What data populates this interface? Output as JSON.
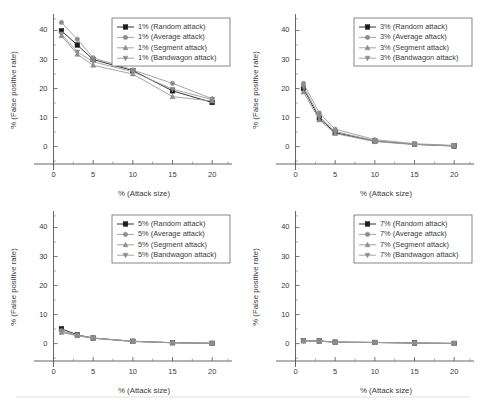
{
  "figure": {
    "background_color": "#ffffff",
    "panel_count": 4,
    "layout": "2x2 grid of line charts"
  },
  "axis": {
    "xlabel": "% (Attack size)",
    "ylabel": "% (False positive rate)",
    "xticks": [
      0,
      5,
      10,
      15,
      20
    ],
    "yticks": [
      0,
      10,
      20,
      30,
      40
    ],
    "xlim": [
      -1.2,
      22.5
    ],
    "ylim": [
      -6,
      45
    ],
    "grid": false
  },
  "series_styles": [
    {
      "key": "random",
      "marker": "filled-square",
      "color": "#1b1b1b",
      "line_color": "#1b1b1b"
    },
    {
      "key": "average",
      "marker": "filled-circle",
      "color": "#8c8c8c",
      "line_color": "#9a9a9a"
    },
    {
      "key": "segment",
      "marker": "up-triangle",
      "color": "#8c8c8c",
      "line_color": "#9a9a9a"
    },
    {
      "key": "bandwagon",
      "marker": "down-triangle",
      "color": "#8c8c8c",
      "line_color": "#9a9a9a"
    }
  ],
  "chart_data": [
    {
      "id": "panel-1pct",
      "type": "line",
      "title": "",
      "xlabel": "% (Attack size)",
      "ylabel": "% (False positive rate)",
      "x": [
        1,
        3,
        5,
        10,
        15,
        20
      ],
      "xlim": [
        -1.2,
        22.5
      ],
      "ylim": [
        -6,
        45
      ],
      "xticks": [
        0,
        5,
        10,
        15,
        20
      ],
      "yticks": [
        0,
        10,
        20,
        30,
        40
      ],
      "grid": false,
      "legend_position": "top-right",
      "series": [
        {
          "name": "1% (Random attack)",
          "key": "random",
          "values": [
            39.9,
            35.0,
            30.0,
            26.2,
            19.2,
            15.2
          ]
        },
        {
          "name": "1% (Average attack)",
          "key": "average",
          "values": [
            42.8,
            37.0,
            30.6,
            26.4,
            21.8,
            16.5
          ]
        },
        {
          "name": "1% (Segment attack)",
          "key": "segment",
          "values": [
            38.2,
            31.8,
            28.0,
            25.0,
            17.2,
            15.7
          ]
        },
        {
          "name": "1% (Bandwagon attack)",
          "key": "bandwagon",
          "values": [
            38.8,
            32.6,
            29.2,
            25.8,
            19.8,
            16.2
          ]
        }
      ]
    },
    {
      "id": "panel-3pct",
      "type": "line",
      "title": "",
      "xlabel": "% (Attack size)",
      "ylabel": "% (False positive rate)",
      "x": [
        1,
        3,
        5,
        10,
        15,
        20
      ],
      "xlim": [
        -1.2,
        22.5
      ],
      "ylim": [
        -6,
        45
      ],
      "xticks": [
        0,
        5,
        10,
        15,
        20
      ],
      "yticks": [
        0,
        10,
        20,
        30,
        40
      ],
      "grid": false,
      "legend_position": "top-right",
      "series": [
        {
          "name": "3% (Random attack)",
          "key": "random",
          "values": [
            20.0,
            9.8,
            4.8,
            1.9,
            0.8,
            0.2
          ]
        },
        {
          "name": "3% (Average attack)",
          "key": "average",
          "values": [
            21.8,
            11.6,
            6.0,
            2.4,
            1.0,
            0.4
          ]
        },
        {
          "name": "3% (Segment attack)",
          "key": "segment",
          "values": [
            18.8,
            9.2,
            4.5,
            1.7,
            0.7,
            0.2
          ]
        },
        {
          "name": "3% (Bandwagon attack)",
          "key": "bandwagon",
          "values": [
            20.6,
            10.4,
            5.2,
            2.0,
            0.8,
            0.3
          ]
        }
      ]
    },
    {
      "id": "panel-5pct",
      "type": "line",
      "title": "",
      "xlabel": "% (Attack size)",
      "ylabel": "% (False positive rate)",
      "x": [
        1,
        3,
        5,
        10,
        15,
        20
      ],
      "xlim": [
        -1.2,
        22.5
      ],
      "ylim": [
        -6,
        45
      ],
      "xticks": [
        0,
        5,
        10,
        15,
        20
      ],
      "yticks": [
        0,
        10,
        20,
        30,
        40
      ],
      "grid": false,
      "legend_position": "top-right",
      "series": [
        {
          "name": "5% (Random attack)",
          "key": "random",
          "values": [
            5.1,
            3.0,
            1.9,
            0.8,
            0.3,
            0.1
          ]
        },
        {
          "name": "5% (Average attack)",
          "key": "average",
          "values": [
            4.4,
            2.9,
            1.9,
            0.8,
            0.3,
            0.1
          ]
        },
        {
          "name": "5% (Segment attack)",
          "key": "segment",
          "values": [
            3.8,
            2.7,
            1.8,
            0.7,
            0.3,
            0.1
          ]
        },
        {
          "name": "5% (Bandwagon attack)",
          "key": "bandwagon",
          "values": [
            4.1,
            2.8,
            1.9,
            0.8,
            0.3,
            0.1
          ]
        }
      ]
    },
    {
      "id": "panel-7pct",
      "type": "line",
      "title": "",
      "xlabel": "% (Attack size)",
      "ylabel": "% (False positive rate)",
      "x": [
        1,
        3,
        5,
        10,
        15,
        20
      ],
      "xlim": [
        -1.2,
        22.5
      ],
      "ylim": [
        -6,
        45
      ],
      "xticks": [
        0,
        5,
        10,
        15,
        20
      ],
      "yticks": [
        0,
        10,
        20,
        30,
        40
      ],
      "grid": false,
      "legend_position": "top-right",
      "series": [
        {
          "name": "7% (Random attack)",
          "key": "random",
          "values": [
            1.0,
            0.9,
            0.5,
            0.4,
            0.2,
            0.05
          ]
        },
        {
          "name": "7% (Average attack)",
          "key": "average",
          "values": [
            1.0,
            0.9,
            0.5,
            0.4,
            0.2,
            0.05
          ]
        },
        {
          "name": "7% (Segment attack)",
          "key": "segment",
          "values": [
            0.9,
            0.8,
            0.5,
            0.35,
            0.2,
            0.05
          ]
        },
        {
          "name": "7% (Bandwagon attack)",
          "key": "bandwagon",
          "values": [
            1.0,
            0.85,
            0.5,
            0.38,
            0.2,
            0.05
          ]
        }
      ]
    }
  ]
}
